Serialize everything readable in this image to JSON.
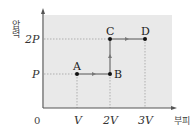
{
  "diagram": {
    "type": "pressure-volume process diagram",
    "y_axis_label": "압력",
    "x_axis_label": "부피",
    "origin_label": "0",
    "y_ticks": [
      "P",
      "2P"
    ],
    "x_ticks": [
      "V",
      "2V",
      "3V"
    ],
    "points": [
      {
        "name": "A",
        "volume": "V",
        "pressure": "P"
      },
      {
        "name": "B",
        "volume": "2V",
        "pressure": "P"
      },
      {
        "name": "C",
        "volume": "2V",
        "pressure": "2P"
      },
      {
        "name": "D",
        "volume": "3V",
        "pressure": "2P"
      }
    ],
    "path": [
      "A",
      "B",
      "C",
      "D"
    ],
    "colors": {
      "background": "#e9e9e9",
      "axis": "#555555",
      "line": "#555555"
    }
  }
}
